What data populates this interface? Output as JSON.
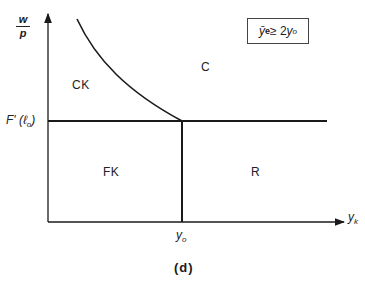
{
  "figure": {
    "caption": "(d)",
    "y_axis": {
      "label_numerator": "w",
      "label_denominator": "p",
      "tick_label_main": "F'",
      "tick_label_arg": "(ℓ",
      "tick_label_arg_sub": "o",
      "tick_label_close": ")"
    },
    "x_axis": {
      "label_main": "y",
      "label_sub": "k",
      "tick_label_main": "y",
      "tick_label_sub": "o"
    },
    "condition": {
      "lhs": "ȳ",
      "lhs_sup": "e",
      "operator": " ≥ 2",
      "rhs": "y",
      "rhs_sub": "o"
    },
    "regions": {
      "upper_left": "CK",
      "upper_right": "C",
      "lower_left": "FK",
      "lower_right": "R"
    }
  },
  "colors": {
    "line": "#1a1a1a",
    "background": "#ffffff"
  }
}
